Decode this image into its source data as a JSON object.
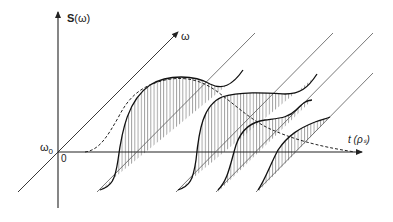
{
  "diagram": {
    "title": "",
    "axes": {
      "vertical": {
        "label_bold": "S",
        "label_rest": "(ω)"
      },
      "diagonal": {
        "label": "ω"
      },
      "horizontal": {
        "label": "t (ρₛ)"
      },
      "origin": {
        "omega0_main": "ω",
        "omega0_sub": "0",
        "zero": "0"
      }
    },
    "slices": [
      {
        "index": 1,
        "hatched": true
      },
      {
        "index": 2,
        "hatched": true
      },
      {
        "index": 3,
        "hatched": true
      },
      {
        "index": 4,
        "hatched": true
      }
    ],
    "envelope": {
      "style": "dashed"
    },
    "colors": {
      "line": "#222222",
      "hatch": "#444444",
      "background": "#ffffff"
    }
  }
}
